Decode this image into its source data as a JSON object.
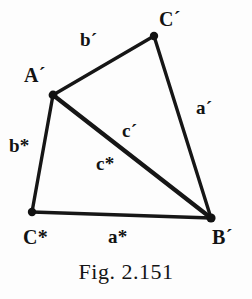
{
  "figure": {
    "caption": "Fig. 2.151",
    "background_color": "#fdfdfd",
    "ink_color": "#1a1a1a",
    "width": 252,
    "height": 299
  },
  "vertices": [
    {
      "id": "C-prime",
      "label": "C´",
      "x": 154,
      "y": 36
    },
    {
      "id": "A-prime",
      "label": "A´",
      "x": 53,
      "y": 95
    },
    {
      "id": "C-star",
      "label": "C*",
      "x": 32,
      "y": 212
    },
    {
      "id": "B-prime",
      "label": "B´",
      "x": 211,
      "y": 218
    }
  ],
  "edges": [
    {
      "id": "edge-b-prime",
      "label": "b´",
      "from": "A-prime",
      "to": "C-prime"
    },
    {
      "id": "edge-a-prime",
      "label": "a´",
      "from": "C-prime",
      "to": "B-prime"
    },
    {
      "id": "edge-b-star",
      "label": "b*",
      "from": "A-prime",
      "to": "C-star"
    },
    {
      "id": "edge-a-star",
      "label": "a*",
      "from": "C-star",
      "to": "B-prime"
    },
    {
      "id": "edge-c-prime",
      "label": "c´",
      "from": "A-prime",
      "to": "B-prime"
    },
    {
      "id": "edge-c-star",
      "label": "c*",
      "from": "A-prime",
      "to": "B-prime"
    }
  ],
  "labels": {
    "vertex_c_prime": "C´",
    "vertex_a_prime": "A´",
    "vertex_c_star": "C*",
    "vertex_b_prime": "B´",
    "edge_b_prime": "b´",
    "edge_a_prime": "a´",
    "edge_b_star": "b*",
    "edge_a_star": "a*",
    "edge_c_prime": "c´",
    "edge_c_star": "c*"
  }
}
